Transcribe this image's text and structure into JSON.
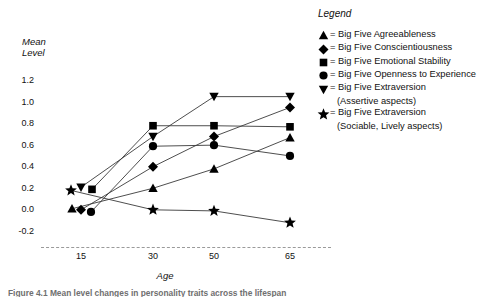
{
  "chart_data": {
    "type": "line",
    "title": "",
    "xlabel": "Age",
    "ylabel": "Mean Level",
    "categories": [
      15,
      30,
      50,
      65
    ],
    "x": [
      15,
      30,
      50,
      65
    ],
    "xlim": [
      10,
      70
    ],
    "ylim": [
      -0.3,
      1.3
    ],
    "yticks": [
      1.2,
      1.0,
      0.8,
      0.6,
      0.4,
      0.2,
      0.0,
      -0.2
    ],
    "ytick_labels": [
      "1.2",
      "1.0",
      "0.8",
      "0.6",
      "0.4",
      "0.2",
      "0.0",
      "-0.2"
    ],
    "xtick_labels": [
      "15",
      "30",
      "50",
      "65"
    ],
    "grid": false,
    "legend_position": "right",
    "legend_title": "Legend",
    "series": [
      {
        "name": "Big Five Agreeableness",
        "marker": "triangle-up",
        "legend_label": "= Big Five Agreeableness",
        "values": [
          0.01,
          0.2,
          0.38,
          0.67
        ]
      },
      {
        "name": "Big Five Conscientiousness",
        "marker": "diamond",
        "legend_label": "= Big Five Conscientiousness",
        "values": [
          0.0,
          0.4,
          0.68,
          0.95
        ]
      },
      {
        "name": "Big Five Emotional Stability",
        "marker": "square",
        "legend_label": "= Big Five Emotional Stability",
        "values": [
          0.19,
          0.78,
          0.78,
          0.77
        ]
      },
      {
        "name": "Big Five Openness to Experience",
        "marker": "circle",
        "legend_label": "= Big Five Openness to Experience",
        "values": [
          -0.02,
          0.59,
          0.6,
          0.5
        ]
      },
      {
        "name": "Big Five Extraversion (Assertive aspects)",
        "marker": "triangle-down",
        "legend_label": "= Big Five Extraversion",
        "legend_sublabel": "(Assertive aspects)",
        "values": [
          0.21,
          0.68,
          1.05,
          1.05
        ]
      },
      {
        "name": "Big Five Extraversion (Sociable, Lively aspects)",
        "marker": "star",
        "legend_label": "= Big Five Extraversion",
        "legend_sublabel": "(Sociable, Lively aspects)",
        "values": [
          0.18,
          0.0,
          -0.01,
          -0.12
        ]
      }
    ],
    "marker_offsets_first_column": {
      "note": "At the youngest age the six markers are fanned horizontally to avoid overlap",
      "order_top_row": [
        "star",
        "triangle-down",
        "square"
      ],
      "order_bottom_row": [
        "triangle-up",
        "diamond",
        "circle"
      ]
    },
    "baseline": {
      "style": "dashed",
      "value": -0.3
    }
  },
  "axes": {
    "y_title": "Mean\nLevel",
    "y_title_line1": "Mean",
    "y_title_line2": "Level",
    "x_title": "Age"
  },
  "legend": {
    "title": "Legend",
    "items": [
      {
        "marker": "triangle-up",
        "label": "= Big Five Agreeableness",
        "sublabel": ""
      },
      {
        "marker": "diamond",
        "label": "= Big Five Conscientiousness",
        "sublabel": ""
      },
      {
        "marker": "square",
        "label": "= Big Five Emotional Stability",
        "sublabel": ""
      },
      {
        "marker": "circle",
        "label": "= Big Five Openness to Experience",
        "sublabel": ""
      },
      {
        "marker": "triangle-down",
        "label": "= Big Five Extraversion",
        "sublabel": "(Assertive aspects)"
      },
      {
        "marker": "star",
        "label": "= Big Five Extraversion",
        "sublabel": "(Sociable, Lively aspects)"
      }
    ]
  },
  "caption": {
    "text": "Figure 4.1  Mean level changes in personality traits across the lifespan"
  }
}
